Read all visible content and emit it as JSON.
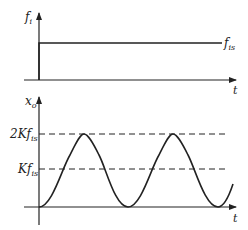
{
  "top_plot": {
    "y_label": "f",
    "y_label_sub": "i",
    "x_label": "t",
    "level_label": "f",
    "level_label_sub": "is"
  },
  "bottom_plot": {
    "y_label": "x",
    "y_label_sub": "o",
    "x_label": "t",
    "upper_level_label_prefix": "2Kf",
    "upper_level_label_sub": "is",
    "mid_level_label_prefix": "Kf",
    "mid_level_label_sub": "is"
  },
  "colors": {
    "line": "#222222",
    "background": "#ffffff"
  }
}
